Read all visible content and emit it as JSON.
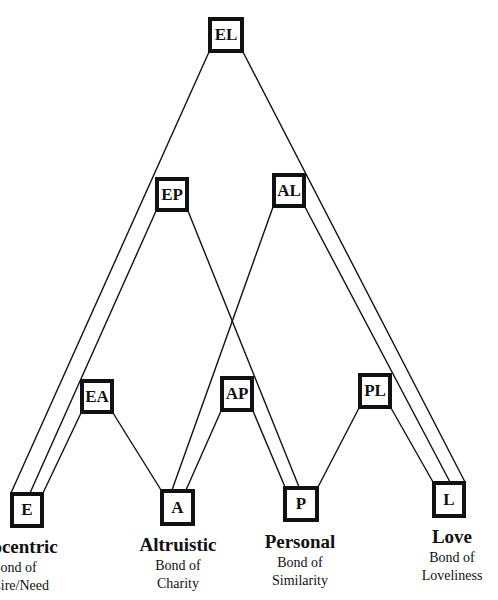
{
  "diagram": {
    "line_color": "#111111",
    "box_border_color": "#111111",
    "nodes": [
      {
        "id": "EL",
        "label": "EL",
        "x": 208,
        "y": 17,
        "w": 36,
        "h": 36
      },
      {
        "id": "EP",
        "label": "EP",
        "x": 155,
        "y": 177,
        "w": 34,
        "h": 35
      },
      {
        "id": "AL",
        "label": "AL",
        "x": 272,
        "y": 173,
        "w": 34,
        "h": 35
      },
      {
        "id": "EA",
        "label": "EA",
        "x": 80,
        "y": 379,
        "w": 34,
        "h": 35
      },
      {
        "id": "AP",
        "label": "AP",
        "x": 220,
        "y": 376,
        "w": 34,
        "h": 36
      },
      {
        "id": "PL",
        "label": "PL",
        "x": 358,
        "y": 373,
        "w": 34,
        "h": 36
      },
      {
        "id": "E",
        "label": "E",
        "x": 10,
        "y": 492,
        "w": 34,
        "h": 36
      },
      {
        "id": "A",
        "label": "A",
        "x": 160,
        "y": 489,
        "w": 35,
        "h": 37
      },
      {
        "id": "P",
        "label": "P",
        "x": 283,
        "y": 486,
        "w": 36,
        "h": 36
      },
      {
        "id": "L",
        "label": "L",
        "x": 432,
        "y": 481,
        "w": 34,
        "h": 37
      }
    ],
    "edges": [
      {
        "from": "EL",
        "to": "E",
        "x1": 209,
        "y1": 52,
        "x2": 11,
        "y2": 493
      },
      {
        "from": "EL",
        "to": "L",
        "x1": 243,
        "y1": 52,
        "x2": 465,
        "y2": 482
      },
      {
        "from": "EP",
        "to": "E",
        "x1": 156,
        "y1": 211,
        "x2": 30,
        "y2": 493
      },
      {
        "from": "EP",
        "to": "P",
        "x1": 188,
        "y1": 211,
        "x2": 299,
        "y2": 487
      },
      {
        "from": "AL",
        "to": "A",
        "x1": 273,
        "y1": 207,
        "x2": 172,
        "y2": 490
      },
      {
        "from": "AL",
        "to": "L",
        "x1": 305,
        "y1": 207,
        "x2": 450,
        "y2": 482
      },
      {
        "from": "EA",
        "to": "E",
        "x1": 81,
        "y1": 413,
        "x2": 43,
        "y2": 493
      },
      {
        "from": "EA",
        "to": "A",
        "x1": 113,
        "y1": 413,
        "x2": 161,
        "y2": 490
      },
      {
        "from": "AP",
        "to": "A",
        "x1": 221,
        "y1": 411,
        "x2": 186,
        "y2": 490
      },
      {
        "from": "AP",
        "to": "P",
        "x1": 253,
        "y1": 411,
        "x2": 285,
        "y2": 487
      },
      {
        "from": "PL",
        "to": "P",
        "x1": 359,
        "y1": 408,
        "x2": 318,
        "y2": 487
      },
      {
        "from": "PL",
        "to": "L",
        "x1": 391,
        "y1": 408,
        "x2": 433,
        "y2": 482
      }
    ]
  },
  "captions": [
    {
      "id": "E",
      "title": "Egocentric",
      "sub_line1": "Bond of",
      "sub_line2": "Desire/Need",
      "cx": 14,
      "y": 537
    },
    {
      "id": "A",
      "title": "Altruistic",
      "sub_line1": "Bond of",
      "sub_line2": "Charity",
      "cx": 178,
      "y": 535
    },
    {
      "id": "P",
      "title": "Personal",
      "sub_line1": "Bond of",
      "sub_line2": "Similarity",
      "cx": 300,
      "y": 532
    },
    {
      "id": "L",
      "title": "Love",
      "sub_line1": "Bond of",
      "sub_line2": "Loveliness",
      "cx": 452,
      "y": 527
    }
  ]
}
